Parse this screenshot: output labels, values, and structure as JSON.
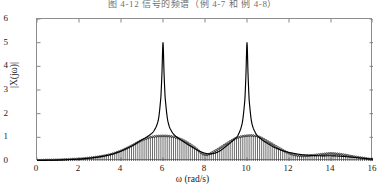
{
  "figure": {
    "caption_truncated": "图 4-12   信号的频谱（例 4-7 和 例 4-8）"
  },
  "chart_data": {
    "type": "line",
    "title": "",
    "xlabel": "ω (rad/s)",
    "ylabel": "|X(jω)|",
    "xlim": [
      0,
      16
    ],
    "ylim": [
      0,
      6
    ],
    "xticks": [
      0,
      2,
      4,
      6,
      8,
      10,
      12,
      14,
      16
    ],
    "yticks": [
      0,
      1,
      2,
      3,
      4,
      5,
      6
    ],
    "grid": false,
    "legend": null,
    "series": [
      {
        "name": "continuous-spectrum-envelope",
        "type": "line",
        "style": "solid-black",
        "description": "Two sharp resonant peaks at omega = 6 and omega = 10, each reaching about 5.0",
        "peaks": [
          {
            "x": 6,
            "y": 5.0
          },
          {
            "x": 10,
            "y": 5.0
          }
        ],
        "x": [
          0.0,
          0.25,
          0.5,
          0.75,
          1.0,
          1.25,
          1.5,
          1.75,
          2.0,
          2.25,
          2.5,
          2.75,
          3.0,
          3.25,
          3.5,
          3.75,
          4.0,
          4.25,
          4.5,
          4.75,
          5.0,
          5.2,
          5.4,
          5.55,
          5.7,
          5.8,
          5.9,
          5.95,
          6.0,
          6.05,
          6.1,
          6.2,
          6.3,
          6.45,
          6.6,
          6.8,
          7.0,
          7.25,
          7.5,
          7.75,
          8.0,
          8.25,
          8.5,
          8.75,
          9.0,
          9.2,
          9.4,
          9.55,
          9.7,
          9.8,
          9.9,
          9.95,
          10.0,
          10.05,
          10.1,
          10.2,
          10.3,
          10.45,
          10.6,
          10.8,
          11.0,
          11.25,
          11.5,
          11.75,
          12.0,
          12.5,
          13.0,
          13.5,
          14.0,
          14.5,
          15.0,
          15.5,
          16.0
        ],
        "y": [
          0.02,
          0.02,
          0.03,
          0.03,
          0.04,
          0.05,
          0.06,
          0.07,
          0.08,
          0.1,
          0.12,
          0.15,
          0.18,
          0.22,
          0.27,
          0.34,
          0.42,
          0.52,
          0.63,
          0.76,
          0.9,
          1.0,
          1.12,
          1.25,
          1.5,
          1.85,
          2.7,
          3.7,
          5.0,
          3.7,
          2.7,
          1.85,
          1.45,
          1.2,
          1.05,
          0.92,
          0.8,
          0.66,
          0.53,
          0.41,
          0.33,
          0.3,
          0.34,
          0.45,
          0.62,
          0.76,
          0.92,
          1.06,
          1.35,
          1.75,
          2.6,
          3.65,
          5.0,
          3.65,
          2.6,
          1.75,
          1.38,
          1.12,
          0.98,
          0.84,
          0.73,
          0.6,
          0.5,
          0.42,
          0.36,
          0.28,
          0.24,
          0.22,
          0.22,
          0.2,
          0.16,
          0.12,
          0.08
        ]
      },
      {
        "name": "sampled-spectrum-stems",
        "type": "stem",
        "style": "vertical-lines-with-round-markers",
        "description": "Discrete stem samples spanning the full axis; envelope peaks near 1.05 at omega = 6 and omega = 10, dips to about 0.25 at omega = 8, small bump near omega = 14",
        "sample_spacing": 0.1,
        "envelope_points": {
          "x": [
            0.0,
            0.5,
            1.0,
            1.5,
            2.0,
            2.5,
            3.0,
            3.5,
            4.0,
            4.5,
            5.0,
            5.5,
            6.0,
            6.5,
            7.0,
            7.5,
            8.0,
            8.5,
            9.0,
            9.5,
            10.0,
            10.5,
            11.0,
            11.5,
            12.0,
            12.5,
            13.0,
            13.5,
            14.0,
            14.5,
            15.0,
            15.5,
            16.0
          ],
          "y": [
            0.03,
            0.04,
            0.05,
            0.07,
            0.09,
            0.13,
            0.19,
            0.28,
            0.43,
            0.64,
            0.88,
            1.02,
            1.06,
            1.02,
            0.86,
            0.58,
            0.26,
            0.44,
            0.72,
            0.97,
            1.07,
            1.04,
            0.82,
            0.56,
            0.33,
            0.22,
            0.23,
            0.28,
            0.32,
            0.28,
            0.2,
            0.13,
            0.07
          ]
        }
      }
    ]
  },
  "axis": {
    "y_tick_labels": [
      "0",
      "1",
      "2",
      "3",
      "4",
      "5",
      "6"
    ],
    "x_tick_labels": [
      "0",
      "2",
      "4",
      "6",
      "8",
      "10",
      "12",
      "14",
      "16"
    ]
  }
}
